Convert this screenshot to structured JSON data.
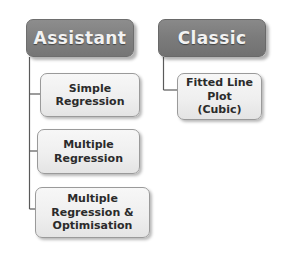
{
  "diagram": {
    "type": "hierarchy-tree",
    "title_visible": false,
    "background_color": "#ffffff",
    "line_color": "#5a5a5a",
    "header_fill": "#7f7f7f",
    "header_text_color": "#f2f2f2",
    "leaf_fill": "#efefef",
    "leaf_text_color": "#2b2b2b",
    "branches": [
      {
        "id": "assistant",
        "header": {
          "label": "Assistant",
          "x": 26,
          "y": 19,
          "width": 108,
          "height": 38
        },
        "children": [
          {
            "id": "simple-regression",
            "label": "Simple\nRegression",
            "x": 40,
            "y": 73,
            "width": 100,
            "height": 44
          },
          {
            "id": "multiple-regression",
            "label": "Multiple\nRegression",
            "x": 37,
            "y": 129,
            "width": 103,
            "height": 45
          },
          {
            "id": "multiple-regression-optimisation",
            "label": "Multiple\nRegression &\nOptimisation",
            "x": 35,
            "y": 187,
            "width": 115,
            "height": 51
          }
        ]
      },
      {
        "id": "classic",
        "header": {
          "label": "Classic",
          "x": 158,
          "y": 19,
          "width": 108,
          "height": 38
        },
        "children": [
          {
            "id": "fitted-line-plot-cubic",
            "label": "Fitted Line\nPlot\n(Cubic)",
            "x": 177,
            "y": 73,
            "width": 85,
            "height": 47
          }
        ]
      }
    ]
  }
}
